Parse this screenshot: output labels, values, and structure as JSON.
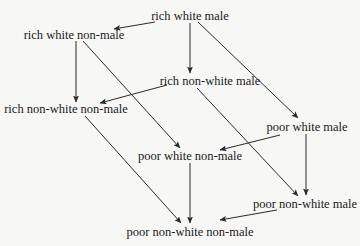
{
  "diagram": {
    "type": "lattice",
    "colors": {
      "background": "#f7f7f5",
      "text": "#1a1a1a",
      "edge": "#2a2a2a"
    },
    "nodes": [
      {
        "id": "rwm",
        "label": "rich white male",
        "x": 190,
        "y": 16
      },
      {
        "id": "rwnm",
        "label": "rich white non-male",
        "x": 74,
        "y": 35
      },
      {
        "id": "rnwm",
        "label": "rich non-white male",
        "x": 210,
        "y": 81
      },
      {
        "id": "rnwnm",
        "label": "rich non-white non-male",
        "x": 66,
        "y": 109
      },
      {
        "id": "pwm",
        "label": "poor white male",
        "x": 307,
        "y": 127
      },
      {
        "id": "pwnm",
        "label": "poor white non-male",
        "x": 190,
        "y": 156
      },
      {
        "id": "pnwm",
        "label": "poor non-white male",
        "x": 305,
        "y": 204
      },
      {
        "id": "pnwnm",
        "label": "poor non-white non-male",
        "x": 190,
        "y": 232
      }
    ],
    "edges": [
      {
        "from": "rwm",
        "to": "rwnm",
        "x1": 155,
        "y1": 22,
        "x2": 114,
        "y2": 29
      },
      {
        "from": "rwm",
        "to": "rnwm",
        "x1": 190,
        "y1": 23,
        "x2": 190,
        "y2": 73
      },
      {
        "from": "rwm",
        "to": "pwm",
        "x1": 198,
        "y1": 22,
        "x2": 298,
        "y2": 118
      },
      {
        "from": "rwnm",
        "to": "rnwnm",
        "x1": 76,
        "y1": 41,
        "x2": 76,
        "y2": 102
      },
      {
        "from": "rwnm",
        "to": "pwnm",
        "x1": 83,
        "y1": 41,
        "x2": 180,
        "y2": 148
      },
      {
        "from": "rnwm",
        "to": "rnwnm",
        "x1": 167,
        "y1": 85,
        "x2": 100,
        "y2": 103
      },
      {
        "from": "rnwm",
        "to": "pnwm",
        "x1": 197,
        "y1": 88,
        "x2": 298,
        "y2": 196
      },
      {
        "from": "rnwnm",
        "to": "pnwnm",
        "x1": 85,
        "y1": 116,
        "x2": 181,
        "y2": 223
      },
      {
        "from": "pwm",
        "to": "pwnm",
        "x1": 280,
        "y1": 135,
        "x2": 220,
        "y2": 150
      },
      {
        "from": "pwm",
        "to": "pnwm",
        "x1": 306,
        "y1": 134,
        "x2": 306,
        "y2": 195
      },
      {
        "from": "pwnm",
        "to": "pnwnm",
        "x1": 190,
        "y1": 163,
        "x2": 190,
        "y2": 223
      },
      {
        "from": "pnwm",
        "to": "pnwnm",
        "x1": 277,
        "y1": 210,
        "x2": 220,
        "y2": 220
      }
    ]
  }
}
